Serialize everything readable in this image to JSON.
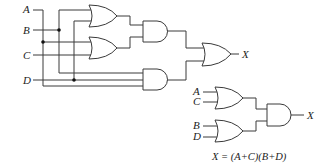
{
  "left_circuit": {
    "inputs": [
      "A",
      "B",
      "C",
      "D"
    ],
    "output": "X",
    "gates": [
      {
        "type": "OR",
        "inputs": [
          "B",
          "D"
        ]
      },
      {
        "type": "OR",
        "inputs": [
          "A",
          "C"
        ]
      },
      {
        "type": "AND",
        "inputs": [
          "OR1",
          "OR2"
        ]
      },
      {
        "type": "AND",
        "inputs": [
          "B",
          "D",
          "A"
        ]
      },
      {
        "type": "OR",
        "inputs": [
          "AND1",
          "AND2"
        ]
      }
    ]
  },
  "right_circuit": {
    "inputs": [
      "A",
      "C",
      "B",
      "D"
    ],
    "output": "X",
    "gates": [
      {
        "type": "OR",
        "inputs": [
          "A",
          "C"
        ]
      },
      {
        "type": "OR",
        "inputs": [
          "B",
          "D"
        ]
      },
      {
        "type": "AND",
        "inputs": [
          "OR1",
          "OR2"
        ]
      }
    ]
  },
  "equation": "X = (A+C)(B+D)"
}
